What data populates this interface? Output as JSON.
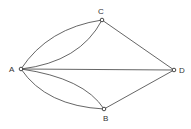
{
  "diagram": {
    "type": "multigraph",
    "nodes": [
      {
        "id": "A",
        "label": "A",
        "x": 21,
        "y": 69,
        "lx": 9,
        "ly": 72
      },
      {
        "id": "C",
        "label": "C",
        "x": 102,
        "y": 20,
        "lx": 98,
        "ly": 14
      },
      {
        "id": "B",
        "label": "B",
        "x": 104,
        "y": 109,
        "lx": 103,
        "ly": 121
      },
      {
        "id": "D",
        "label": "D",
        "x": 174,
        "y": 70,
        "lx": 179,
        "ly": 73
      }
    ],
    "edges": [
      {
        "from": "A",
        "to": "C",
        "curve": "outer"
      },
      {
        "from": "A",
        "to": "C",
        "curve": "inner"
      },
      {
        "from": "A",
        "to": "B",
        "curve": "outer"
      },
      {
        "from": "A",
        "to": "B",
        "curve": "inner"
      },
      {
        "from": "A",
        "to": "D",
        "curve": "straight"
      },
      {
        "from": "C",
        "to": "D",
        "curve": "straight"
      },
      {
        "from": "B",
        "to": "D",
        "curve": "straight"
      }
    ]
  }
}
